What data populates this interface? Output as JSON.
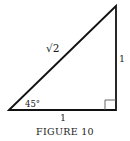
{
  "figure": {
    "caption": "FIGURE 10",
    "hypotenuse_label": "√2",
    "vertical_side_label": "1",
    "horizontal_side_label": "1",
    "angle_label": "45°"
  },
  "colors": {
    "stroke": "#111111",
    "text": "#1a1a1a",
    "right_angle_marker": "#555555"
  }
}
